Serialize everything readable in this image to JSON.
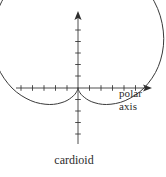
{
  "figure": {
    "title": "cardioid",
    "caption": "cardioid",
    "axis_label_line1": "polar",
    "axis_label_line2": "axis",
    "curve_name": "cardioid-curve",
    "line_color": "#3a3a3a",
    "text_color": "#2b2b2b",
    "background_color": "#ffffff"
  },
  "chart_data": {
    "type": "line",
    "title": "cardioid",
    "subtitle": "",
    "xlabel": "polar axis",
    "ylabel": "",
    "coordinate_system": "polar",
    "equation": "r = a(1 + sin(theta))",
    "grid": false,
    "legend": "none",
    "annotations": [
      {
        "text": "polar",
        "position": "right-of-horizontal-axis-arrow"
      },
      {
        "text": "axis",
        "position": "right-of-horizontal-axis-arrow-second-line"
      },
      {
        "text": "cardioid",
        "position": "below-figure-center"
      }
    ],
    "axes": {
      "horizontal": {
        "label": "polar axis",
        "arrow": "right",
        "tick_count": 12,
        "tick_spacing_px": 11.5,
        "origin_px": {
          "x": 78,
          "y": 88
        },
        "start_px": 16,
        "end_px": 152
      },
      "vertical": {
        "label": "",
        "arrow": "up",
        "tick_count": 11,
        "tick_spacing_px": 11.5,
        "origin_px": {
          "x": 78,
          "y": 88
        },
        "start_px": 12,
        "end_px": 144
      }
    },
    "curve": {
      "name": "cardioid",
      "cusp": {
        "r": 0,
        "theta_deg": 270
      },
      "max_radius": {
        "r": 2,
        "theta_deg": 90
      },
      "polar_points": [
        {
          "theta_deg": 270,
          "r": 0.0
        },
        {
          "theta_deg": 285,
          "r": 0.07
        },
        {
          "theta_deg": 300,
          "r": 0.27
        },
        {
          "theta_deg": 315,
          "r": 0.59
        },
        {
          "theta_deg": 330,
          "r": 1.0
        },
        {
          "theta_deg": 345,
          "r": 1.48
        },
        {
          "theta_deg": 0,
          "r": 2.0
        },
        {
          "theta_deg": 15,
          "r": 2.52
        },
        {
          "theta_deg": 30,
          "r": 3.0
        },
        {
          "theta_deg": 45,
          "r": 3.41
        },
        {
          "theta_deg": 60,
          "r": 3.73
        },
        {
          "theta_deg": 75,
          "r": 3.93
        },
        {
          "theta_deg": 90,
          "r": 4.0
        },
        {
          "theta_deg": 105,
          "r": 3.93
        },
        {
          "theta_deg": 120,
          "r": 3.73
        },
        {
          "theta_deg": 135,
          "r": 3.41
        },
        {
          "theta_deg": 150,
          "r": 3.0
        },
        {
          "theta_deg": 165,
          "r": 2.52
        },
        {
          "theta_deg": 180,
          "r": 2.0
        },
        {
          "theta_deg": 195,
          "r": 1.48
        },
        {
          "theta_deg": 210,
          "r": 1.0
        },
        {
          "theta_deg": 225,
          "r": 0.59
        },
        {
          "theta_deg": 240,
          "r": 0.27
        },
        {
          "theta_deg": 255,
          "r": 0.07
        },
        {
          "theta_deg": 270,
          "r": 0.0
        }
      ],
      "extent_px": {
        "left": 47,
        "right": 109,
        "top": 22,
        "bottom": 88
      }
    }
  }
}
